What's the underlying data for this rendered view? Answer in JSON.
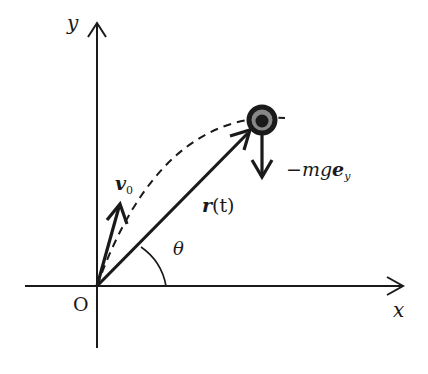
{
  "diagram": {
    "type": "projectile-motion",
    "colors": {
      "ink": "#1a1a1a",
      "mass_ring": "#888888",
      "background": "#ffffff"
    },
    "axes": {
      "x_label": "x",
      "y_label": "y",
      "origin_label": "O"
    },
    "vectors": {
      "initial_velocity": {
        "symbol": "v",
        "subscript": "0"
      },
      "position": {
        "symbol": "r",
        "arg": "(t)"
      },
      "gravity": {
        "prefix": "−mg",
        "symbol": "e",
        "subscript": "y"
      }
    },
    "angle": {
      "label": "θ"
    },
    "trajectory": {
      "style": "dashed",
      "shape": "parabola"
    },
    "mass": {
      "shape": "ring"
    }
  }
}
